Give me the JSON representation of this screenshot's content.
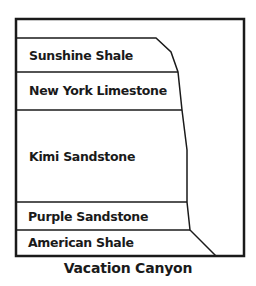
{
  "diagram": {
    "title": "Vacation Canyon",
    "layers": [
      {
        "name": "Sunshine Shale"
      },
      {
        "name": "New York Limestone"
      },
      {
        "name": "Kimi Sandstone"
      },
      {
        "name": "Purple Sandstone"
      },
      {
        "name": "American Shale"
      }
    ],
    "colors": {
      "stroke": "#1a1a1a",
      "background": "#ffffff"
    }
  }
}
